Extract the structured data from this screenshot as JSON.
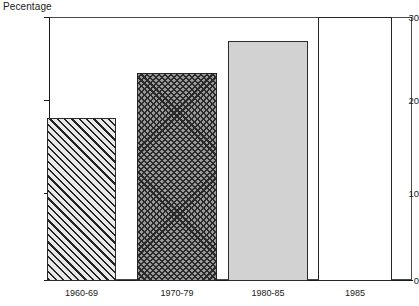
{
  "axis_title": "Pecentage",
  "chart_data": {
    "type": "bar",
    "title": "",
    "subtitle": "",
    "xlabel": "",
    "ylabel": "Pecentage",
    "ylim": [
      0,
      30
    ],
    "yticks": [
      0,
      10,
      20,
      30
    ],
    "ytick_labels": [
      "0",
      "10",
      "20",
      "30"
    ],
    "grid": false,
    "legend": false,
    "categories": [
      "1960-69",
      "1970-79",
      "1980-85",
      "1985"
    ],
    "values": [
      19.0,
      23.6,
      27.2,
      30.0
    ],
    "bar_styles": [
      "diagonal-hatch",
      "cross-hatch",
      "solid-light-gray",
      "white-outline"
    ],
    "colors": {
      "axis": "#1a1a1a",
      "frame": "#4a4a4a",
      "bar_hatch_fill": "#d7d7d7",
      "bar_hatch_line": "#222222",
      "bar_cross_fill": "#9a9a9a",
      "bar_cross_line": "#2a2a2a",
      "bar_solid_fill": "#d2d2d2",
      "bar_open_fill": "#ffffff",
      "bar_outline": "#2b2b2b"
    }
  },
  "y_ticks": [
    {
      "label": "30",
      "top": 17
    },
    {
      "label": "20",
      "top": 100
    },
    {
      "label": "10",
      "top": 193
    },
    {
      "label": "0",
      "top": 280
    }
  ],
  "bars": [
    {
      "label": "1960-69",
      "value": 19.0,
      "left": 47,
      "width": 69,
      "top": 118,
      "height": 163,
      "style": "bar-hatch",
      "label_left": 47,
      "label_width": 69
    },
    {
      "label": "1970-79",
      "value": 23.6,
      "left": 137,
      "width": 80,
      "top": 73,
      "height": 208,
      "style": "bar-cross",
      "label_left": 137,
      "label_width": 80
    },
    {
      "label": "1980-85",
      "value": 27.2,
      "left": 228,
      "width": 80,
      "top": 41,
      "height": 240,
      "style": "bar-solid",
      "label_left": 228,
      "label_width": 80
    },
    {
      "label": "1985",
      "value": 30.0,
      "left": 318,
      "width": 74,
      "top": 17,
      "height": 264,
      "style": "bar-open",
      "label_left": 318,
      "label_width": 74
    }
  ]
}
